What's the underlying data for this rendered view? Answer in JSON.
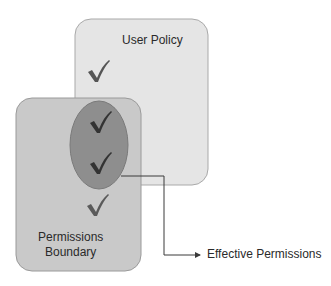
{
  "diagram": {
    "user_policy": {
      "label": "User Policy",
      "fill": "#e5e5e5",
      "stroke": "#a9a9a9"
    },
    "permissions_boundary": {
      "label_line1": "Permissions",
      "label_line2": "Boundary",
      "fill": "#c9c9c9",
      "stroke": "#9a9a9a"
    },
    "intersection": {
      "fill": "#8e8e8e",
      "stroke": "#7a7a7a"
    },
    "effective_permissions": {
      "label": "Effective Permissions"
    },
    "check_icon": "check-mark",
    "check_color": "#4a4a4a"
  }
}
